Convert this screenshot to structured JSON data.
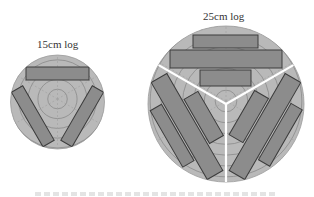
{
  "figure": {
    "small_log": {
      "label": "15cm log",
      "diameter_cm": 15,
      "center": [
        57.5,
        102
      ],
      "radius": 47,
      "rings": 6,
      "boards": [
        {
          "x": 26,
          "y": 67,
          "w": 63,
          "h": 13,
          "rotate": 0
        }
      ],
      "rotation_copies": [
        0,
        120,
        240
      ]
    },
    "large_log": {
      "label": "25cm log",
      "diameter_cm": 25,
      "center": [
        226,
        104
      ],
      "radius": 78,
      "rings": 9,
      "dividers": "Y-shaped (3 sectors at 120°)",
      "boards": [
        {
          "x": 193,
          "y": 35,
          "w": 65,
          "h": 13
        },
        {
          "x": 170,
          "y": 50,
          "w": 112,
          "h": 18
        },
        {
          "x": 200,
          "y": 70,
          "w": 51,
          "h": 16
        }
      ],
      "rotation_copies": [
        0,
        120,
        240
      ]
    },
    "colors": {
      "log_fill": "#b9b9b9",
      "ring_stroke": "#8a8a8a",
      "board_fill": "#8c8c8c",
      "board_stroke": "#3c3c3c",
      "divider": "#ffffff"
    }
  }
}
